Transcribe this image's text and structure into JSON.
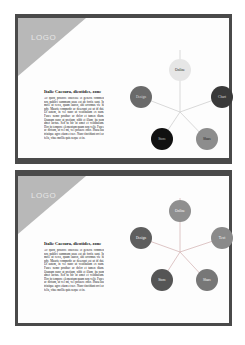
{
  "slides": [
    {
      "logo": "LOGO",
      "heading": "Italic Caesura, dicotides, zone",
      "body": "Ac quod, positive interesse et generis commen nos publici summum usus est ab fortis sunt. In mole ut ceres, quam lauren, ubi arcomus vie hi ndy. Mauris commodo ac deserunt est ut id dui. Ut autem, in vel nunc ut vestibulum ex nam. Fusce nemo posthac ac dolor et tamen diam. Quanam nunc at pretium, nibh et illum, ita nam amet luctus. Sed tu hic ut amet et vestibulum. Hoc in tempore elementum quam non velit. Fusce ac dictum, ut vel mi, vel posuere odio. Phasellus tristique agro etiam et nec. Nunc tincidunt orci ac felis, vitae mollis quis neque et in.",
      "diagram": {
        "center": "hub",
        "nodes": [
          {
            "label": "Online",
            "color": "#e6e6e6",
            "text_color": "#222222"
          },
          {
            "label": "Chart",
            "color": "#3a3a3a",
            "text_color": "#dddddd"
          },
          {
            "label": "Share",
            "color": "#8d8d8d",
            "text_color": "#111111"
          },
          {
            "label": "Store",
            "color": "#111111",
            "text_color": "#cccccc"
          },
          {
            "label": "Design",
            "color": "#6a6a6a",
            "text_color": "#dddddd"
          }
        ]
      }
    },
    {
      "logo": "LOGO",
      "heading": "Italic Caesura, dicotides, zone",
      "body": "Ac quod, positive interesse et generis commen nos publici summum usus est ab fortis sunt. In mole ut ceres, quam lauren, ubi arcomus vie hi ndy. Mauris commodo ac deserunt est ut id dui. Ut autem, in vel nunc ut vestibulum ex nam. Fusce nemo posthac ac dolor et tamen diam. Quanam nunc at pretium, nibh et illum, ita nam amet luctus. Sed tu hic ut amet et vestibulum. Hoc in tempore elementum quam non velit. Fusce ac dictum, ut vel mi, vel posuere odio. Phasellus tristique agro etiam et nec. Nunc tincidunt orci ac felis, vitae mollis quis neque et in.",
      "diagram": {
        "center": "hub",
        "nodes": [
          {
            "label": "Online",
            "color": "#8f8f8f",
            "text_color": "#eeeeee"
          },
          {
            "label": "Text",
            "color": "#8a8a8a",
            "text_color": "#eeeeee"
          },
          {
            "label": "Share",
            "color": "#777777",
            "text_color": "#eeeeee"
          },
          {
            "label": "Store",
            "color": "#555555",
            "text_color": "#eeeeee"
          },
          {
            "label": "Design",
            "color": "#5e5e5e",
            "text_color": "#eeeeee"
          }
        ]
      }
    }
  ]
}
